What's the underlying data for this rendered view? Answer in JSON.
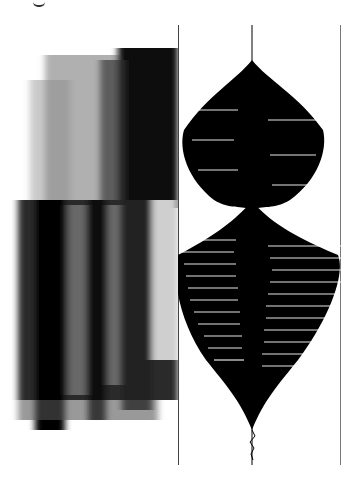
{
  "figure": {
    "type": "scanned-figure",
    "left_panel": "spectrogram",
    "right_panel": "waveform",
    "colors": {
      "ink": "#000000",
      "paper": "#ffffff",
      "rule": "#444444"
    }
  }
}
